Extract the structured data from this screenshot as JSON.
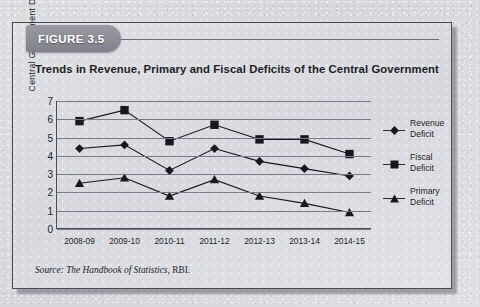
{
  "figure": {
    "tab_label": "FIGURE 3.5",
    "title": "Trends in Revenue, Primary and Fiscal Deficits of the Central Government",
    "source_prefix": "Source:",
    "source_italic": "The Handbook of Statistics",
    "source_suffix": ", RBI."
  },
  "legend": {
    "items": [
      {
        "label_line1": "Revenue",
        "label_line2": "Deficit",
        "marker": "diamond-marker-icon"
      },
      {
        "label_line1": "Fiscal",
        "label_line2": "Deficit",
        "marker": "square-marker-icon"
      },
      {
        "label_line1": "Primary",
        "label_line2": "Deficit",
        "marker": "triangle-marker-icon"
      }
    ]
  },
  "colors": {
    "ink": "#1d1f26",
    "frame": "#4b4d55",
    "gridline": "#7b7d86",
    "tab_fill": "#8b8c94",
    "marker": "#17181d",
    "paper": "#dcdde1"
  },
  "chart_data": {
    "type": "line",
    "title": "Trends in Revenue, Primary and Fiscal Deficits of the Central Government",
    "xlabel": "",
    "ylabel": "Central  Government  Deficit",
    "categories": [
      "2008-09",
      "2009-10",
      "2010-11",
      "2011-12",
      "2012-13",
      "2013-14",
      "2014-15"
    ],
    "ylim": [
      0,
      7
    ],
    "yticks": [
      0,
      1,
      2,
      3,
      4,
      5,
      6,
      7
    ],
    "grid": true,
    "legend_position": "right",
    "series": [
      {
        "name": "Revenue Deficit",
        "marker": "diamond",
        "values": [
          4.4,
          4.6,
          3.2,
          4.4,
          3.7,
          3.3,
          2.9
        ]
      },
      {
        "name": "Fiscal Deficit",
        "marker": "square",
        "values": [
          5.9,
          6.5,
          4.8,
          5.7,
          4.9,
          4.9,
          4.1
        ]
      },
      {
        "name": "Primary Deficit",
        "marker": "triangle",
        "values": [
          2.5,
          2.8,
          1.8,
          2.7,
          1.8,
          1.4,
          0.9
        ]
      }
    ]
  }
}
